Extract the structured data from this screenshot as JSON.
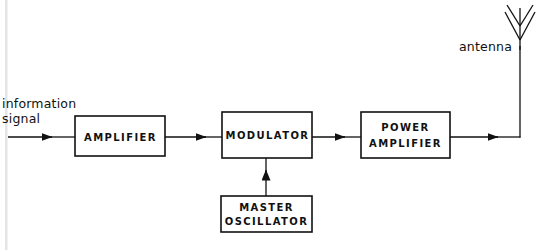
{
  "diagram": {
    "background_color": "#ffffff",
    "line_color": "#111111",
    "blocks": [
      {
        "id": "amplifier",
        "label_line1": "AMPLIFIER",
        "label_line2": ""
      },
      {
        "id": "modulator",
        "label_line1": "MODULATOR",
        "label_line2": ""
      },
      {
        "id": "power-amplifier",
        "label_line1": "POWER",
        "label_line2": "AMPLIFIER"
      },
      {
        "id": "master-oscillator",
        "label_line1": "MASTER",
        "label_line2": "OSCILLATOR"
      }
    ],
    "labels": {
      "input_line1": "information",
      "input_line2": "signal",
      "antenna": "antenna"
    },
    "icons": {
      "antenna": "antenna-icon",
      "arrow": "arrow-right-icon"
    }
  }
}
